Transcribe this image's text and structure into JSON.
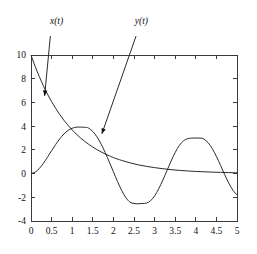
{
  "chart_data": {
    "type": "line",
    "title": "",
    "xlabel": "",
    "ylabel": "",
    "xlim": [
      0,
      5
    ],
    "ylim": [
      -4,
      10
    ],
    "grid": false,
    "legend_position": "inline-annotations",
    "xticks": [
      "0",
      "0.5",
      "1",
      "1.5",
      "2",
      "2.5",
      "3",
      "3.5",
      "4",
      "4.5",
      "5"
    ],
    "xtick_values": [
      0,
      0.5,
      1,
      1.5,
      2,
      2.5,
      3,
      3.5,
      4,
      4.5,
      5
    ],
    "yticks": [
      "10",
      "8",
      "6",
      "4",
      "2",
      "0",
      "-2",
      "-4"
    ],
    "ytick_values": [
      10,
      8,
      6,
      4,
      2,
      0,
      -2,
      -4
    ],
    "series": [
      {
        "name": "x(t)",
        "label": "x(t)",
        "color": "#2b2b2b",
        "annotation": {
          "label": "x(t)",
          "label_x": 0.62,
          "label_y": 12.6,
          "arrow_from_x": 0.47,
          "arrow_from_y": 11.6,
          "arrow_to_x": 0.33,
          "arrow_to_y": 6.55
        },
        "x": [
          0,
          0.1,
          0.2,
          0.3,
          0.4,
          0.5,
          0.6,
          0.7,
          0.8,
          0.9,
          1,
          1.1,
          1.2,
          1.3,
          1.4,
          1.5,
          1.6,
          1.7,
          1.8,
          1.9,
          2,
          2.2,
          2.4,
          2.6,
          2.8,
          3,
          3.2,
          3.4,
          3.6,
          3.8,
          4,
          4.2,
          4.4,
          4.6,
          4.8,
          5
        ],
        "values": [
          10,
          9.05,
          8.19,
          7.41,
          6.7,
          6.07,
          5.49,
          4.97,
          4.49,
          4.07,
          3.68,
          3.33,
          3.01,
          2.73,
          2.47,
          2.23,
          2.02,
          1.83,
          1.65,
          1.5,
          1.35,
          1.11,
          0.91,
          0.74,
          0.61,
          0.5,
          0.41,
          0.33,
          0.27,
          0.22,
          0.18,
          0.15,
          0.12,
          0.1,
          0.08,
          0.07
        ]
      },
      {
        "name": "y(t)",
        "label": "y(t)",
        "color": "#2b2b2b",
        "annotation": {
          "label": "y(t)",
          "label_x": 2.68,
          "label_y": 12.6,
          "arrow_from_x": 2.55,
          "arrow_from_y": 11.6,
          "arrow_to_x": 1.72,
          "arrow_to_y": 3.35
        },
        "x": [
          0,
          0.1,
          0.2,
          0.3,
          0.4,
          0.5,
          0.6,
          0.7,
          0.8,
          0.9,
          1,
          1.1,
          1.2,
          1.3,
          1.35,
          1.4,
          1.5,
          1.6,
          1.7,
          1.8,
          1.9,
          2,
          2.1,
          2.2,
          2.3,
          2.4,
          2.5,
          2.6,
          2.7,
          2.8,
          2.9,
          3,
          3.1,
          3.2,
          3.3,
          3.4,
          3.5,
          3.6,
          3.7,
          3.8,
          3.9,
          4,
          4.1,
          4.15,
          4.2,
          4.3,
          4.4,
          4.5,
          4.6,
          4.7,
          4.8,
          4.9,
          5
        ],
        "values": [
          0,
          0.12,
          0.42,
          0.86,
          1.38,
          1.93,
          2.46,
          2.94,
          3.34,
          3.64,
          3.82,
          3.91,
          3.92,
          3.9,
          3.89,
          3.83,
          3.55,
          3.1,
          2.5,
          1.78,
          0.98,
          0.15,
          -0.67,
          -1.42,
          -2.02,
          -2.4,
          -2.52,
          -2.55,
          -2.52,
          -2.49,
          -2.3,
          -1.88,
          -1.28,
          -0.55,
          0.25,
          1.05,
          1.78,
          2.37,
          2.76,
          2.94,
          2.99,
          3,
          2.99,
          2.98,
          2.9,
          2.6,
          2.1,
          1.45,
          0.7,
          -0.08,
          -0.8,
          -1.4,
          -1.8
        ]
      }
    ]
  }
}
